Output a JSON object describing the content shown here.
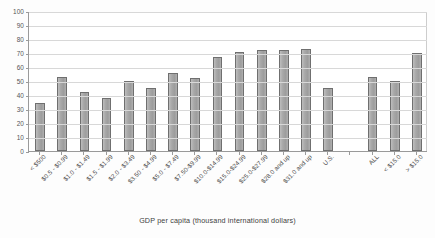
{
  "chart_data": {
    "type": "bar",
    "title": "",
    "xlabel": "GDP per capita (thousand international dollars)",
    "ylabel": "",
    "ylim": [
      0,
      100
    ],
    "ytick_step": 10,
    "ytick_labels": [
      "0",
      "10",
      "20",
      "30",
      "40",
      "50",
      "60",
      "70",
      "80",
      "90",
      "100"
    ],
    "grid": true,
    "legend": "none",
    "bar_color": "#a3a3a3",
    "bar_edge_color": "#6f6f6f",
    "gap_after_index": 14,
    "categories": [
      "< $500",
      "$0.5 - $0.99",
      "$1.0 - $1.49",
      "$1.5 - $1.99",
      "$2.0 - $3.49",
      "$3.50 - $4.99",
      "$5.0 - $7.49",
      "$7.50-$9.99",
      "$10.0-$14.99",
      "$15.0-$24.99",
      "$25.0-$27.99",
      "$28.0 and up",
      "$31.0 and up",
      "U.S.",
      "",
      "ALL",
      "< $15.0",
      "> $15.0"
    ],
    "values": [
      34,
      53,
      42,
      38,
      50,
      45,
      56,
      52,
      67,
      71,
      72,
      72,
      73,
      45,
      null,
      53,
      50,
      70
    ]
  },
  "axis": {
    "x_title": "GDP per capita (thousand international dollars)"
  }
}
